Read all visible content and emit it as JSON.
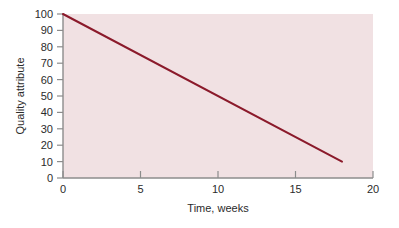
{
  "chart_data": {
    "type": "line",
    "title": "",
    "subtitle": "",
    "xlabel": "Time, weeks",
    "ylabel": "Quality attribute",
    "xlim": [
      0,
      20
    ],
    "ylim": [
      0,
      100
    ],
    "xticks": [
      0,
      5,
      10,
      15,
      20
    ],
    "xtick_labels": [
      "0",
      "5",
      "10",
      "15",
      "20"
    ],
    "yticks": [
      0,
      10,
      20,
      30,
      40,
      50,
      60,
      70,
      80,
      90,
      100
    ],
    "ytick_labels": [
      "0",
      "10",
      "20",
      "30",
      "40",
      "50",
      "60",
      "70",
      "80",
      "90",
      "100"
    ],
    "grid": false,
    "legend": false,
    "legend_position": "none",
    "plot_background_color": "#f1e1e3",
    "page_background_color": "#ffffff",
    "axis_color": "#8c8c8c",
    "series": [
      {
        "name": "Quality attribute decline",
        "color": "#8b1a2b",
        "line_width": 2,
        "x": [
          0,
          18
        ],
        "values": [
          100,
          10
        ],
        "points": [
          {
            "x": 0,
            "y": 100
          },
          {
            "x": 1,
            "y": 95
          },
          {
            "x": 2,
            "y": 90
          },
          {
            "x": 3,
            "y": 85
          },
          {
            "x": 4,
            "y": 80
          },
          {
            "x": 5,
            "y": 75
          },
          {
            "x": 6,
            "y": 70
          },
          {
            "x": 7,
            "y": 65
          },
          {
            "x": 8,
            "y": 60
          },
          {
            "x": 9,
            "y": 55
          },
          {
            "x": 10,
            "y": 50
          },
          {
            "x": 11,
            "y": 45
          },
          {
            "x": 12,
            "y": 40
          },
          {
            "x": 13,
            "y": 35
          },
          {
            "x": 14,
            "y": 30
          },
          {
            "x": 15,
            "y": 25
          },
          {
            "x": 16,
            "y": 20
          },
          {
            "x": 17,
            "y": 15
          },
          {
            "x": 18,
            "y": 10
          }
        ],
        "slope_per_week": -5
      }
    ]
  },
  "axis": {
    "x_title": "Time, weeks",
    "y_title": "Quality attribute",
    "x_labels": [
      "0",
      "5",
      "10",
      "15",
      "20"
    ],
    "y_labels": [
      "100",
      "90",
      "80",
      "70",
      "60",
      "50",
      "40",
      "30",
      "20",
      "10",
      "0"
    ]
  }
}
